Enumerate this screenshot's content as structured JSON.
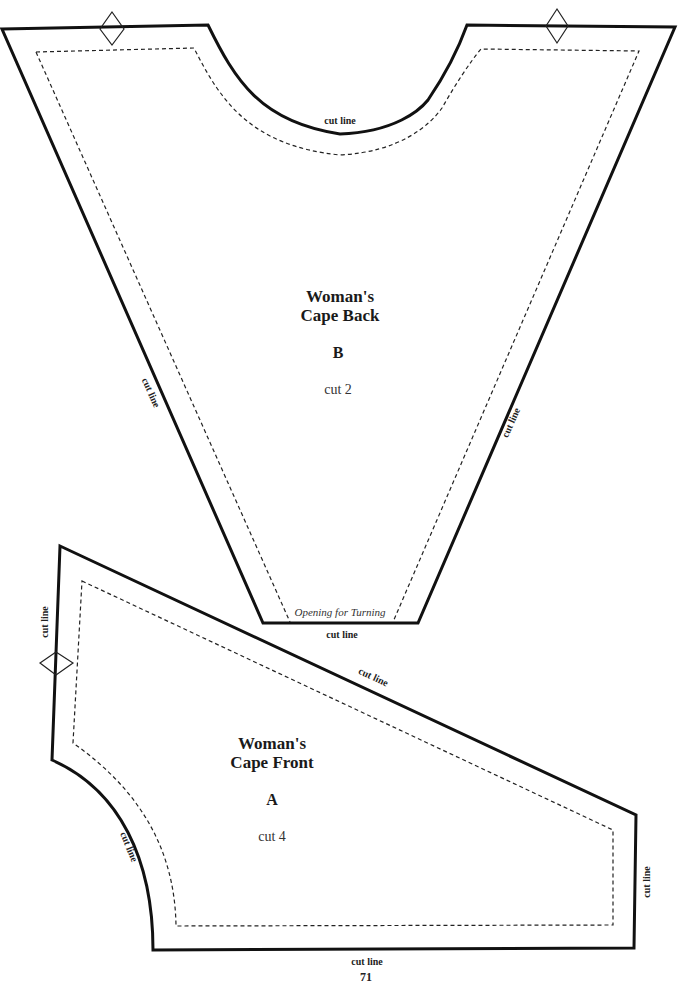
{
  "pieces": {
    "back": {
      "title_line1": "Woman's",
      "title_line2": "Cape Back",
      "letter": "B",
      "cut_count": "cut 2",
      "neck_label": "cut line",
      "left_label": "cut line",
      "right_label": "cut line",
      "bottom_label": "cut line",
      "opening_label": "Opening for Turning"
    },
    "front": {
      "title_line1": "Woman's",
      "title_line2": "Cape Front",
      "letter": "A",
      "cut_count": "cut 4",
      "left_label": "cut line",
      "diagonal_label": "cut line",
      "curve_label": "cut line",
      "right_label": "cut line",
      "bottom_label": "cut line"
    }
  },
  "page_number": "71",
  "colors": {
    "line": "#111111",
    "background": "#ffffff"
  }
}
